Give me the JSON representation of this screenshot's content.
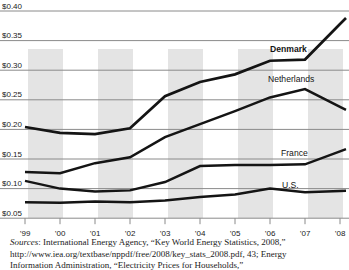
{
  "figure": {
    "background": "#ffffff",
    "band_color": "#e4e4e4",
    "gridline_color": "#8a8a8a",
    "line_color": "#141414",
    "text_color": "#1a1a1a"
  },
  "chart_data": {
    "type": "line",
    "title": "",
    "xlabel": "",
    "ylabel": "",
    "x_categories": [
      "’99",
      "’00",
      "’01",
      "’02",
      "’03",
      "’04",
      "’05",
      "’06",
      "’07",
      "’08"
    ],
    "y_tick_labels": [
      "$0.40",
      "$0.35",
      "$0.30",
      "$0.25",
      "$0.20",
      "$0.15",
      "$0.10",
      "$0.05"
    ],
    "y_tick_values": [
      0.4,
      0.35,
      0.3,
      0.25,
      0.2,
      0.15,
      0.1,
      0.05
    ],
    "ylim": [
      0.05,
      0.4
    ],
    "grid": "horizontal-gridlines-on",
    "background_bands": "alternating vertical gray bands covering year spans 99-00, 01-02, 03-04, 05-06, 07-08",
    "legend_position": "inline-labels-right",
    "series": [
      {
        "name": "Denmark",
        "bold_label": true,
        "label_pos": [
          270,
          52
        ],
        "values": [
          0.204,
          0.194,
          0.192,
          0.202,
          0.256,
          0.28,
          0.293,
          0.316,
          0.318,
          0.378
        ]
      },
      {
        "name": "Netherlands",
        "bold_label": false,
        "label_pos": [
          268,
          82
        ],
        "values": [
          0.128,
          0.126,
          0.143,
          0.153,
          0.187,
          0.209,
          0.231,
          0.254,
          0.268,
          0.238
        ]
      },
      {
        "name": "France",
        "bold_label": false,
        "label_pos": [
          281,
          156
        ],
        "values": [
          0.113,
          0.1,
          0.095,
          0.097,
          0.111,
          0.138,
          0.14,
          0.14,
          0.141,
          0.163
        ]
      },
      {
        "name": "U.S.",
        "bold_label": false,
        "label_pos": [
          282,
          187.5
        ],
        "values": [
          0.077,
          0.076,
          0.078,
          0.077,
          0.08,
          0.086,
          0.09,
          0.1,
          0.094,
          0.096
        ]
      }
    ]
  },
  "sources": {
    "prefix": "Sources",
    "line1_rest": ": International Energy Agency, “Key World Energy Statistics, 2008,”",
    "line2": "http://www.iea.org/textbase/nppdf/free/2008/key_stats_2008.pdf, 43; Energy",
    "line3": "Information Administration, “Electricity Prices for Households,”"
  }
}
